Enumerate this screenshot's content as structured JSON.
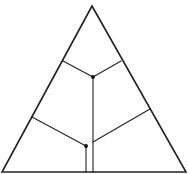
{
  "diagram": {
    "type": "triangular-partition",
    "canvas": {
      "width": 188,
      "height": 174
    },
    "colors": {
      "line": "#222222",
      "node": "#111111",
      "background": "#ffffff"
    },
    "triangle": {
      "apex": [
        92,
        6
      ],
      "bottom_left": [
        2,
        172
      ],
      "bottom_right": [
        186,
        172
      ]
    },
    "nodes": [
      {
        "id": "upper-node",
        "pos": [
          93,
          77
        ]
      },
      {
        "id": "lower-node",
        "pos": [
          86,
          146
        ]
      }
    ],
    "edges": [
      {
        "id": "upper-left-branch",
        "from": [
          63,
          61
        ],
        "to": [
          93,
          77
        ]
      },
      {
        "id": "upper-right-branch",
        "from": [
          121,
          61
        ],
        "to": [
          93,
          77
        ]
      },
      {
        "id": "upper-vertical",
        "from": [
          93,
          77
        ],
        "to": [
          93,
          172
        ]
      },
      {
        "id": "lower-left-branch",
        "from": [
          32,
          117
        ],
        "to": [
          86,
          146
        ]
      },
      {
        "id": "lower-right-branch",
        "from": [
          150,
          109
        ],
        "to": [
          93,
          142
        ]
      },
      {
        "id": "lower-vertical",
        "from": [
          86,
          146
        ],
        "to": [
          86,
          172
        ]
      }
    ],
    "labels": []
  }
}
